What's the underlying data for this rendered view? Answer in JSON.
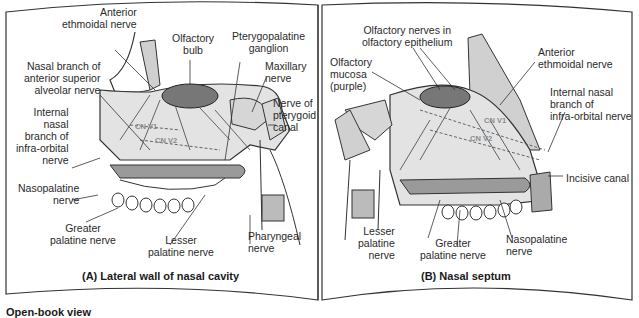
{
  "panel_a": {
    "caption": "(A) Lateral wall of nasal cavity",
    "labels": {
      "anterior_ethmoidal": "Anterior\nethmoidal nerve",
      "olfactory_bulb": "Olfactory\nbulb",
      "pterygopalatine": "Pterygopalatine\nganglion",
      "maxillary": "Maxillary\nnerve",
      "nerve_pterygoid": "Nerve of\npterygoid\ncanal",
      "nasal_branch": "Nasal branch of\nanterior superior\nalveolar nerve",
      "internal_nasal": "Internal\nnasal\nbranch of\ninfra-orbital\nnerve",
      "nasopalatine": "Nasopalatine\nnerve",
      "greater_palatine": "Greater\npalatine nerve",
      "lesser_palatine": "Lesser\npalatine nerve",
      "pharyngeal": "Pharyngeal\nnerve",
      "cn_v1": "CN V1",
      "cn_v2": "CN V2"
    }
  },
  "panel_b": {
    "caption": "(B) Nasal septum",
    "labels": {
      "olfactory_nerves": "Olfactory nerves in\nolfactory epithelium",
      "olfactory_mucosa": "Olfactory\nmucosa\n(purple)",
      "anterior_ethmoidal": "Anterior\nethmoidal nerve",
      "internal_nasal": "Internal nasal\nbranch of\ninfra-orbital nerve",
      "incisive_canal": "Incisive canal",
      "lesser_palatine": "Lesser\npalatine\nnerve",
      "greater_palatine": "Greater\npalatine nerve",
      "nasopalatine": "Nasopalatine\nnerve",
      "cn_v1": "CN V1",
      "cn_v2": "CN V2"
    }
  },
  "footer": {
    "label": "Open-book view"
  },
  "colors": {
    "fill": "#e4e4e4",
    "bone": "#cfcfcf",
    "stroke": "#333333",
    "page": "#ffffff"
  }
}
